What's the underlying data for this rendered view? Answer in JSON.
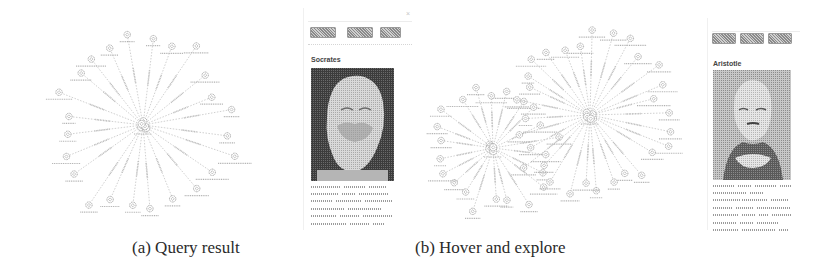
{
  "figure": {
    "subfigures": [
      {
        "id": "a",
        "caption": "(a) Query result",
        "side_panel": {
          "search_placeholder": "",
          "clear_icon": "close-icon",
          "buttons": [
            "",
            "",
            ""
          ],
          "entity_title": "Socrates",
          "portrait": "socrates-bust-image",
          "description_lines": 6
        },
        "graph": {
          "layout": "single-radial",
          "hubs": 1,
          "spokes": 24
        }
      },
      {
        "id": "b",
        "caption": "(b) Hover and explore",
        "side_panel": {
          "search_placeholder": "",
          "clear_icon": "close-icon",
          "buttons": [
            "",
            "",
            ""
          ],
          "entity_title": "Aristotle",
          "portrait": "aristotle-bust-image",
          "description_lines": 7
        },
        "graph": {
          "layout": "double-radial",
          "hubs": 2,
          "spokes": [
            22,
            30
          ]
        }
      }
    ]
  },
  "colors": {
    "edge": "#c4c4c4",
    "node": "#8f8f8f",
    "label": "#b0b0b0",
    "button": "#9a9a9a",
    "caption": "#2a2a2a"
  }
}
